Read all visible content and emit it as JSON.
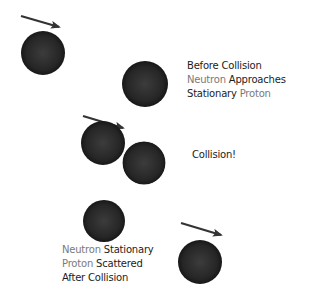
{
  "colors": {
    "particle": "#2a2a2a",
    "arrow": "#333333",
    "text_dark": "#1c1c1c",
    "text_grey": "#7a7a7a"
  },
  "stage_before": {
    "line1": [
      "Before Collision"
    ],
    "line2_grey": "Neutron",
    "line2_dark": "Approaches",
    "line3_dark": "Stationary",
    "line3_grey": "Proton"
  },
  "stage_collision": {
    "label": "Collision!"
  },
  "stage_after": {
    "line1_grey": "Neutron",
    "line1_dark": "Stationary",
    "line2_grey": "Proton",
    "line2_dark": "Scattered",
    "line3_dark": "After Collision"
  },
  "particles": [
    {
      "name": "neutron-before",
      "cx": 43,
      "cy": 53,
      "r": 22
    },
    {
      "name": "proton-before",
      "cx": 145,
      "cy": 84,
      "r": 23
    },
    {
      "name": "neutron-collision",
      "cx": 103,
      "cy": 143,
      "r": 22
    },
    {
      "name": "proton-collision",
      "cx": 144,
      "cy": 163,
      "r": 22
    },
    {
      "name": "neutron-after",
      "cx": 104,
      "cy": 221,
      "r": 21
    },
    {
      "name": "proton-after",
      "cx": 200,
      "cy": 262,
      "r": 22
    }
  ]
}
